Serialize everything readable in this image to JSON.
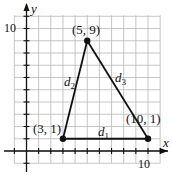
{
  "diagram": {
    "type": "coordinate-plane-triangle",
    "axes": {
      "x_label": "x",
      "y_label": "y",
      "x_tick_label": "10",
      "y_tick_label": "10",
      "x_range": [
        -1,
        11
      ],
      "y_range": [
        -1,
        11
      ]
    },
    "points": [
      {
        "label": "(5, 9)",
        "x": 5,
        "y": 9
      },
      {
        "label": "(3, 1)",
        "x": 3,
        "y": 1
      },
      {
        "label": "(10, 1)",
        "x": 10,
        "y": 1
      }
    ],
    "segments": [
      {
        "name": "d",
        "sub": "1",
        "from": "(3, 1)",
        "to": "(10, 1)"
      },
      {
        "name": "d",
        "sub": "2",
        "from": "(3, 1)",
        "to": "(5, 9)"
      },
      {
        "name": "d",
        "sub": "3",
        "from": "(5, 9)",
        "to": "(10, 1)"
      }
    ],
    "colors": {
      "grid": "#b8b8b8",
      "axes": "#111111",
      "lines": "#111111"
    }
  }
}
